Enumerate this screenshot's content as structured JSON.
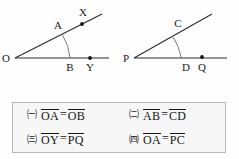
{
  "figures": {
    "left": {
      "vertex_label": "O",
      "point_on_ray_label": "A",
      "point_on_base_label": "B",
      "endpoint_upper_label": "X",
      "endpoint_base_label": "Y"
    },
    "right": {
      "vertex_label": "P",
      "point_on_ray_label": "C",
      "point_on_base_label": "D",
      "endpoint_base_label": "Q"
    }
  },
  "options": [
    {
      "marker": "㈠",
      "left": "OA",
      "relation": "=",
      "right": "OB"
    },
    {
      "marker": "㈡",
      "left": "AB",
      "relation": "=",
      "right": "CD"
    },
    {
      "marker": "㈢",
      "left": "OY",
      "relation": "=",
      "right": "PQ"
    },
    {
      "marker": "㈣",
      "left": "OA",
      "relation": "=",
      "right": "PC"
    }
  ],
  "colors": {
    "line": "#2b2b2b",
    "arc": "#6e6e6e",
    "text": "#151515",
    "box_border": "#b9b9b9",
    "box_background": "#f7f7f7",
    "page_background": "#fefefe"
  }
}
